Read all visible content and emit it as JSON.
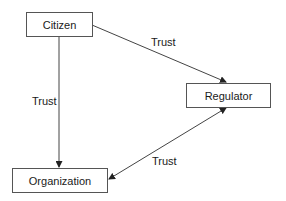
{
  "diagram": {
    "nodes": [
      {
        "id": "citizen",
        "label": "Citizen"
      },
      {
        "id": "regulator",
        "label": "Regulator"
      },
      {
        "id": "organization",
        "label": "Organization"
      }
    ],
    "edges": [
      {
        "from": "citizen",
        "to": "regulator",
        "label": "Trust",
        "direction": "forward"
      },
      {
        "from": "citizen",
        "to": "organization",
        "label": "Trust",
        "direction": "forward"
      },
      {
        "from": "organization",
        "to": "regulator",
        "label": "Trust",
        "direction": "both"
      }
    ]
  }
}
